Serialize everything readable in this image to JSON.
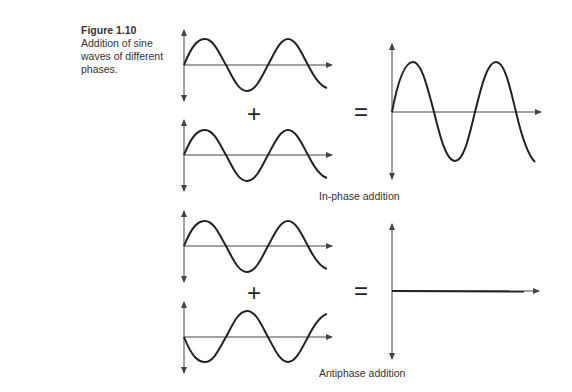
{
  "caption": {
    "figure_number": "Figure 1.10",
    "text": "Addition of sine waves of different phases."
  },
  "operators": {
    "plus": "+",
    "equals": "="
  },
  "panels": [
    {
      "name": "in-phase",
      "label": "In-phase addition",
      "input_a": "sine, phase 0°, 2 cycles",
      "input_b": "sine, phase 0°, 2 cycles",
      "result": "sine, double amplitude, 2 cycles"
    },
    {
      "name": "antiphase",
      "label": "Antiphase addition",
      "input_a": "sine, phase 0°, 2 cycles",
      "input_b": "sine, phase 180°, 2 cycles",
      "result": "flat line (zero)"
    }
  ],
  "colors": {
    "line": "#222222",
    "axis": "#444444"
  }
}
